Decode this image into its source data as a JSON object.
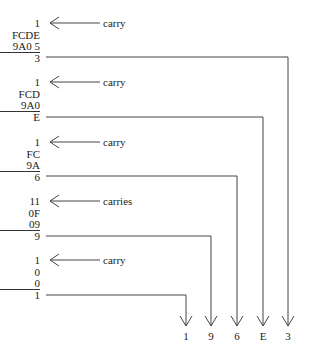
{
  "blocks": [
    {
      "carry": "1",
      "top": "FCDE",
      "bottom": "9A0 5",
      "result": "3",
      "label": "carry"
    },
    {
      "carry": "1",
      "top": "FCD",
      "bottom": "9A0",
      "result": "E",
      "label": "carry"
    },
    {
      "carry": "1",
      "top": "FC",
      "bottom": "9A",
      "result": "6",
      "label": "carry"
    },
    {
      "carry": "11",
      "top": "0F",
      "bottom": "09",
      "result": "9",
      "label": "carries"
    },
    {
      "carry": "1",
      "top": "0",
      "bottom": "0",
      "result": "1",
      "label": "carry"
    }
  ],
  "final_digits": [
    "1",
    "9",
    "6",
    "E",
    "3"
  ],
  "colors": {
    "line": "#444444",
    "text": "#222222"
  }
}
